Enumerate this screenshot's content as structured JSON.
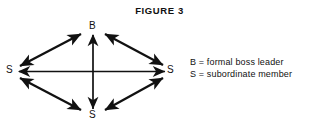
{
  "figure": {
    "title": "FIGURE 3",
    "background_color": "#ffffff",
    "ink_color": "#111111"
  },
  "diagram": {
    "type": "node-link-diamond",
    "nodes": [
      {
        "id": "top",
        "label": "B",
        "position": "top",
        "x": 93,
        "y": 26
      },
      {
        "id": "left",
        "label": "S",
        "position": "left",
        "x": 11,
        "y": 71
      },
      {
        "id": "right",
        "label": "S",
        "position": "right",
        "x": 171,
        "y": 71
      },
      {
        "id": "bottom",
        "label": "S",
        "position": "bottom",
        "x": 93,
        "y": 116
      }
    ],
    "edges": [
      {
        "from": "left",
        "to": "top",
        "arrow": "double"
      },
      {
        "from": "top",
        "to": "right",
        "arrow": "double"
      },
      {
        "from": "left",
        "to": "bottom",
        "arrow": "double"
      },
      {
        "from": "bottom",
        "to": "right",
        "arrow": "double"
      },
      {
        "from": "left",
        "to": "right",
        "arrow": "double"
      },
      {
        "from": "top",
        "to": "bottom",
        "arrow": "double"
      }
    ],
    "node_labels": {
      "top": "B",
      "left": "S",
      "right": "S",
      "bottom": "S"
    }
  },
  "legend": {
    "lines": [
      "B = formal boss leader",
      "S = subordinate member"
    ],
    "entries": [
      {
        "symbol": "B",
        "separator": "=",
        "description": "formal boss leader"
      },
      {
        "symbol": "S",
        "separator": "=",
        "description": "subordinate member"
      }
    ]
  }
}
